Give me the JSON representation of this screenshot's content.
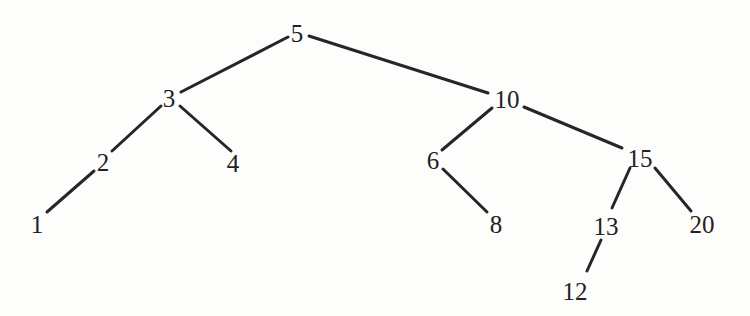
{
  "figure": {
    "kind": "binary-search-tree-diagram",
    "background_color": "#fdfdfc",
    "edge_color": "#262626",
    "label_color": "#222222",
    "edge_width": 3,
    "width": 750,
    "height": 316
  },
  "tree": {
    "root": "5",
    "nodes": [
      {
        "id": "n5",
        "label": "5",
        "x": 297,
        "y": 33,
        "depth": 0
      },
      {
        "id": "n3",
        "label": "3",
        "x": 169,
        "y": 98,
        "depth": 1
      },
      {
        "id": "n10",
        "label": "10",
        "x": 507,
        "y": 99,
        "depth": 1
      },
      {
        "id": "n2",
        "label": "2",
        "x": 103,
        "y": 162,
        "depth": 2
      },
      {
        "id": "n4",
        "label": "4",
        "x": 233,
        "y": 163,
        "depth": 2
      },
      {
        "id": "n6",
        "label": "6",
        "x": 433,
        "y": 160,
        "depth": 2
      },
      {
        "id": "n15",
        "label": "15",
        "x": 640,
        "y": 158,
        "depth": 2
      },
      {
        "id": "n1",
        "label": "1",
        "x": 37,
        "y": 224,
        "depth": 3
      },
      {
        "id": "n8",
        "label": "8",
        "x": 496,
        "y": 224,
        "depth": 3
      },
      {
        "id": "n13",
        "label": "13",
        "x": 606,
        "y": 226,
        "depth": 3
      },
      {
        "id": "n20",
        "label": "20",
        "x": 702,
        "y": 224,
        "depth": 3
      },
      {
        "id": "n12",
        "label": "12",
        "x": 575,
        "y": 291,
        "depth": 4
      }
    ],
    "edges": [
      {
        "from": "5",
        "to": "3",
        "x1": 288,
        "y1": 37,
        "x2": 181,
        "y2": 92
      },
      {
        "from": "5",
        "to": "10",
        "x1": 309,
        "y1": 36,
        "x2": 488,
        "y2": 93
      },
      {
        "from": "3",
        "to": "2",
        "x1": 161,
        "y1": 106,
        "x2": 112,
        "y2": 151
      },
      {
        "from": "3",
        "to": "4",
        "x1": 180,
        "y1": 106,
        "x2": 231,
        "y2": 151
      },
      {
        "from": "2",
        "to": "1",
        "x1": 94,
        "y1": 171,
        "x2": 47,
        "y2": 212
      },
      {
        "from": "10",
        "to": "6",
        "x1": 492,
        "y1": 108,
        "x2": 442,
        "y2": 150
      },
      {
        "from": "10",
        "to": "15",
        "x1": 524,
        "y1": 107,
        "x2": 622,
        "y2": 148
      },
      {
        "from": "6",
        "to": "8",
        "x1": 443,
        "y1": 169,
        "x2": 487,
        "y2": 212
      },
      {
        "from": "15",
        "to": "13",
        "x1": 630,
        "y1": 168,
        "x2": 612,
        "y2": 208
      },
      {
        "from": "15",
        "to": "20",
        "x1": 655,
        "y1": 168,
        "x2": 691,
        "y2": 211
      },
      {
        "from": "13",
        "to": "12",
        "x1": 601,
        "y1": 240,
        "x2": 587,
        "y2": 271
      }
    ]
  }
}
